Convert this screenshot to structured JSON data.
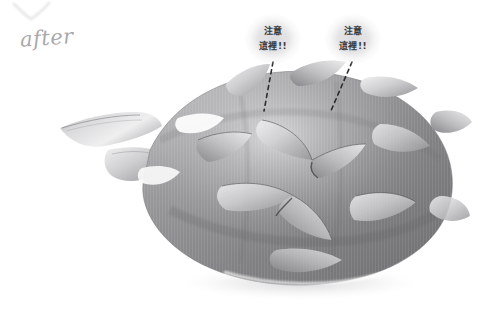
{
  "page": {
    "background_color": "#ffffff"
  },
  "artwork": {
    "subject": "dragon-fruit",
    "medium": "graphite pencil drawing",
    "description": "Shaded pencil rendering of a dragon fruit (pitaya) with leafy scale spikes, lying on its side, soft cast shadow beneath",
    "palette": {
      "paper": "#ffffff",
      "lightest_tone": "#f2f2f3",
      "light_tone": "#d6d6d8",
      "mid_tone": "#8a8a8a",
      "dark_tone": "#5f5f60",
      "darkest_tone": "#3d3d3e",
      "shadow": "#e8e8ea"
    }
  },
  "labels": {
    "after": "after",
    "tick_mark": "check-mark"
  },
  "callouts": [
    {
      "id": "callout-1",
      "line1": "注意",
      "line2": "這裡!!",
      "bubble_x": 245,
      "bubble_y": 13,
      "leader": {
        "x1": 273,
        "y1": 62,
        "x2": 264,
        "y2": 111
      }
    },
    {
      "id": "callout-2",
      "line1": "注意",
      "line2": "這裡!!",
      "bubble_x": 325,
      "bubble_y": 13,
      "leader": {
        "x1": 352,
        "y1": 62,
        "x2": 330,
        "y2": 113
      }
    }
  ],
  "leader_style": {
    "color": "#2c2c2c",
    "dash": "4 4",
    "width": 1.6
  }
}
